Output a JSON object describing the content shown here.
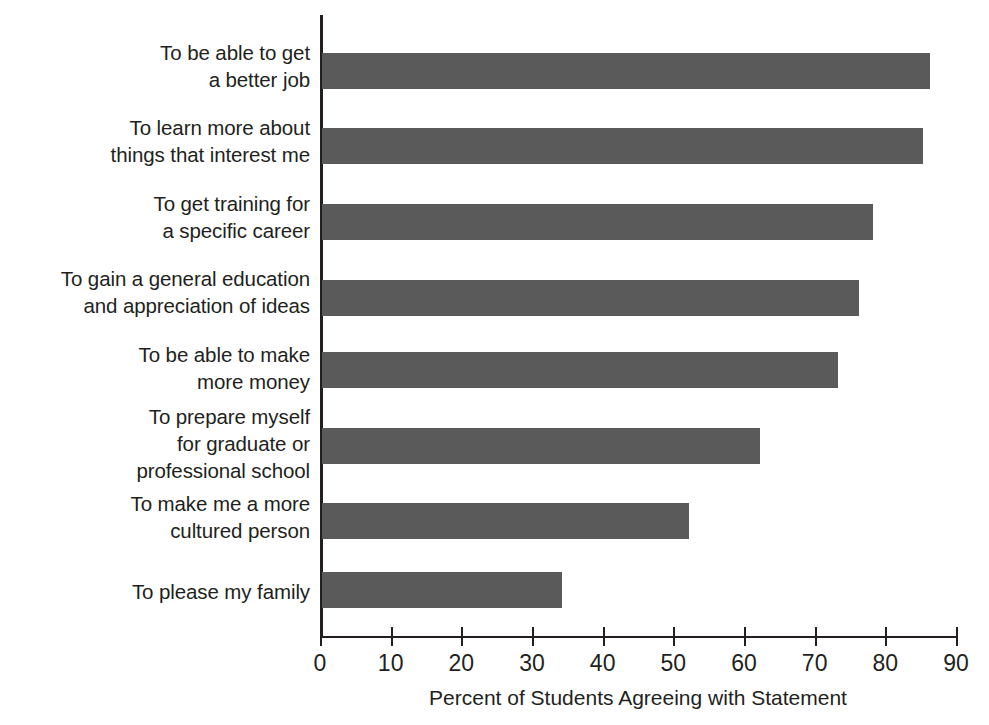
{
  "chart_data": {
    "type": "bar",
    "orientation": "horizontal",
    "title": "",
    "xlabel": "Percent of Students Agreeing with Statement",
    "ylabel": "",
    "xlim": [
      0,
      90
    ],
    "xticks": [
      0,
      10,
      20,
      30,
      40,
      50,
      60,
      70,
      80,
      90
    ],
    "grid": false,
    "legend": false,
    "bar_color": "#5a5a5a",
    "background_color": "#ffffff",
    "axis_color": "#231f20",
    "categories": [
      "To be able to get\na better job",
      "To learn more about\nthings that interest me",
      "To get training for\na specific career",
      "To gain a general education\nand appreciation of ideas",
      "To be able to make\nmore money",
      "To prepare myself\nfor graduate or\nprofessional school",
      "To make me a more\ncultured person",
      "To please my family"
    ],
    "values": [
      86,
      85,
      78,
      76,
      73,
      62,
      52,
      34
    ]
  }
}
